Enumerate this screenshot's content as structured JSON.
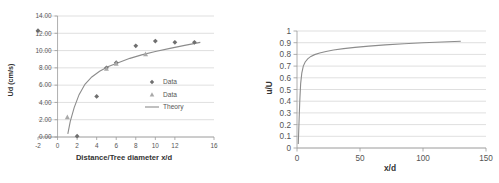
{
  "figure": {
    "panels": [
      "left-chart",
      "right-chart"
    ]
  },
  "chart_data": [
    {
      "id": "left-chart",
      "type": "scatter",
      "title": "",
      "xlabel": "Distance/Tree diameter x/d",
      "ylabel": "Ud (cm/s)",
      "xlim": [
        -2,
        16
      ],
      "ylim": [
        0.0,
        14.0
      ],
      "xticks": [
        -2,
        0,
        2,
        4,
        6,
        8,
        10,
        12,
        16
      ],
      "xtick_labels": [
        "-2",
        "0",
        "2",
        "4",
        "6",
        "8",
        "10",
        "12",
        "16"
      ],
      "yticks": [
        0.0,
        2.0,
        4.0,
        6.0,
        8.0,
        10.0,
        12.0,
        14.0
      ],
      "ytick_labels": [
        "0.00",
        "2.00",
        "4.00",
        "6.00",
        "8.00",
        "10.00",
        "12.00",
        "14.00"
      ],
      "grid": "horizontal",
      "legend_position": "inside-right",
      "legend": [
        {
          "label": "Data",
          "marker": "diamond",
          "color": "#6f6f6f"
        },
        {
          "label": "Data",
          "marker": "triangle",
          "color": "#a9a9a9"
        },
        {
          "label": "Theory",
          "marker": "line",
          "color": "#8c8c8c"
        }
      ],
      "series": [
        {
          "name": "Data",
          "marker": "diamond",
          "color": "#6f6f6f",
          "points": [
            {
              "x": -2.0,
              "y": 12.3
            },
            {
              "x": 2.0,
              "y": 0.1
            },
            {
              "x": 4.0,
              "y": 4.7
            },
            {
              "x": 5.0,
              "y": 8.0
            },
            {
              "x": 6.0,
              "y": 8.6
            },
            {
              "x": 8.0,
              "y": 10.55
            },
            {
              "x": 10.0,
              "y": 11.1
            },
            {
              "x": 12.0,
              "y": 10.95
            },
            {
              "x": 14.0,
              "y": 10.95
            }
          ]
        },
        {
          "name": "Data",
          "marker": "triangle",
          "color": "#a9a9a9",
          "points": [
            {
              "x": 1.0,
              "y": 2.3
            },
            {
              "x": 5.0,
              "y": 7.9
            },
            {
              "x": 6.0,
              "y": 8.5
            },
            {
              "x": 9.0,
              "y": 9.6
            }
          ]
        },
        {
          "name": "Theory",
          "marker": "line",
          "color": "#8c8c8c",
          "points": [
            {
              "x": 1.05,
              "y": 0.35
            },
            {
              "x": 1.3,
              "y": 1.8
            },
            {
              "x": 1.7,
              "y": 3.4
            },
            {
              "x": 2.2,
              "y": 4.9
            },
            {
              "x": 2.8,
              "y": 6.1
            },
            {
              "x": 3.5,
              "y": 6.95
            },
            {
              "x": 4.3,
              "y": 7.6
            },
            {
              "x": 5.2,
              "y": 8.15
            },
            {
              "x": 6.2,
              "y": 8.6
            },
            {
              "x": 7.4,
              "y": 9.1
            },
            {
              "x": 8.6,
              "y": 9.5
            },
            {
              "x": 10.0,
              "y": 9.9
            },
            {
              "x": 11.5,
              "y": 10.25
            },
            {
              "x": 13.0,
              "y": 10.6
            },
            {
              "x": 14.6,
              "y": 10.95
            }
          ]
        }
      ]
    },
    {
      "id": "right-chart",
      "type": "line",
      "title": "",
      "xlabel": "x/d",
      "ylabel": "u/U",
      "xlim": [
        0,
        150
      ],
      "ylim": [
        0,
        1
      ],
      "xticks": [
        0,
        50,
        100,
        150
      ],
      "xtick_labels": [
        "0",
        "50",
        "100",
        "150"
      ],
      "yticks": [
        0,
        0.1,
        0.2,
        0.3,
        0.4,
        0.5,
        0.6,
        0.7,
        0.8,
        0.9,
        1
      ],
      "ytick_labels": [
        "0",
        "0.1",
        "0.2",
        "0.3",
        "0.4",
        "0.5",
        "0.6",
        "0.7",
        "0.8",
        "0.9",
        "1"
      ],
      "grid": "horizontal",
      "legend_position": "none",
      "legend": [],
      "series": [
        {
          "name": "u/U",
          "marker": "line",
          "color": "#8c8c8c",
          "points": [
            {
              "x": 1.0,
              "y": 0.035
            },
            {
              "x": 1.6,
              "y": 0.22
            },
            {
              "x": 2.2,
              "y": 0.4
            },
            {
              "x": 2.9,
              "y": 0.55
            },
            {
              "x": 3.8,
              "y": 0.64
            },
            {
              "x": 5.0,
              "y": 0.7
            },
            {
              "x": 6.5,
              "y": 0.735
            },
            {
              "x": 8.5,
              "y": 0.762
            },
            {
              "x": 11.0,
              "y": 0.783
            },
            {
              "x": 14.0,
              "y": 0.798
            },
            {
              "x": 18.0,
              "y": 0.812
            },
            {
              "x": 23.0,
              "y": 0.825
            },
            {
              "x": 29.0,
              "y": 0.837
            },
            {
              "x": 37.0,
              "y": 0.849
            },
            {
              "x": 46.0,
              "y": 0.86
            },
            {
              "x": 57.0,
              "y": 0.871
            },
            {
              "x": 70.0,
              "y": 0.881
            },
            {
              "x": 85.0,
              "y": 0.891
            },
            {
              "x": 100.0,
              "y": 0.899
            },
            {
              "x": 115.0,
              "y": 0.906
            },
            {
              "x": 130.0,
              "y": 0.912
            }
          ]
        }
      ]
    }
  ]
}
